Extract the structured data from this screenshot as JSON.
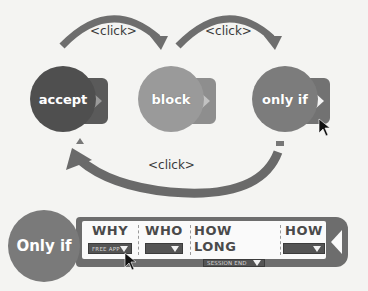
{
  "diagram": {
    "states": [
      {
        "id": "accept",
        "label": "accept",
        "color": "#4f4f4f"
      },
      {
        "id": "block",
        "label": "block",
        "color": "#9a9a9a"
      },
      {
        "id": "only-if",
        "label": "only if",
        "color": "#7c7c7c"
      }
    ],
    "transitions": [
      {
        "from": "accept",
        "to": "block",
        "label": "<click>"
      },
      {
        "from": "block",
        "to": "only-if",
        "label": "<click>"
      },
      {
        "from": "only-if",
        "to": "accept",
        "label": "<click>"
      }
    ]
  },
  "only_if_bar": {
    "label": "Only if",
    "columns": [
      {
        "header": "WHY",
        "value": "FREE APP"
      },
      {
        "header": "WHO",
        "value": ""
      },
      {
        "header": "HOW LONG",
        "value": "SESSION END"
      },
      {
        "header": "HOW",
        "value": ""
      }
    ]
  }
}
